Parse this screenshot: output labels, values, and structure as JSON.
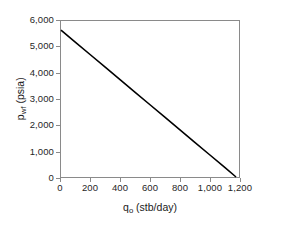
{
  "chart_data": {
    "type": "line",
    "title": "",
    "subtitle": "",
    "xlabel_base": "q",
    "xlabel_sub": "o",
    "xlabel_unit": " (stb/day)",
    "xlabel": "q_o (stb/day)",
    "ylabel_base": "p",
    "ylabel_sub": "wf",
    "ylabel_unit": " (psia)",
    "ylabel": "p_wf (psia)",
    "xlim": [
      0,
      1200
    ],
    "ylim": [
      0,
      6000
    ],
    "xticks": [
      0,
      200,
      400,
      600,
      800,
      1000,
      1200
    ],
    "yticks": [
      0,
      1000,
      2000,
      3000,
      4000,
      5000,
      6000
    ],
    "xtick_labels": [
      "0",
      "200",
      "400",
      "600",
      "800",
      "1,000",
      "1,200"
    ],
    "ytick_labels": [
      "0",
      "1,000",
      "2,000",
      "3,000",
      "4,000",
      "5,000",
      "6,000"
    ],
    "grid": false,
    "legend": false,
    "legend_position": "none",
    "line_color": "#000000",
    "axis_color": "#8a8a8a",
    "background_color": "#ffffff",
    "series": [
      {
        "name": "IPR",
        "color": "#000000",
        "line_width": 1.6,
        "x": [
          0,
          1180
        ],
        "y": [
          5650,
          0
        ],
        "points": [
          {
            "x": 0,
            "y": 5650
          },
          {
            "x": 100,
            "y": 5171
          },
          {
            "x": 200,
            "y": 4693
          },
          {
            "x": 300,
            "y": 4214
          },
          {
            "x": 400,
            "y": 3736
          },
          {
            "x": 500,
            "y": 3258
          },
          {
            "x": 600,
            "y": 2779
          },
          {
            "x": 700,
            "y": 2301
          },
          {
            "x": 800,
            "y": 1822
          },
          {
            "x": 900,
            "y": 1344
          },
          {
            "x": 1000,
            "y": 866
          },
          {
            "x": 1100,
            "y": 387
          },
          {
            "x": 1180,
            "y": 0
          }
        ]
      }
    ]
  }
}
